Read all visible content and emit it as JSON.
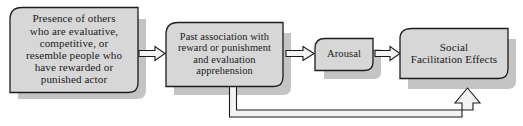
{
  "diagram": {
    "type": "flowchart",
    "orientation": "left-to-right",
    "colors": {
      "box_fill": "#d7d7d7",
      "box_stroke": "#1c1c1c",
      "shadow": "#c4c4c4",
      "arrow_fill": "#f2f2f2",
      "arrow_stroke": "#1c1c1c",
      "text": "#1a1a1a",
      "background": "#ffffff"
    },
    "nodes": [
      {
        "id": "n1",
        "label": "Presence of others\nwho are evaluative,\ncompetitive, or\nresemble people who\nhave rewarded or\npunished actor"
      },
      {
        "id": "n2",
        "label": "Past association with\nreward or punishment\nand evaluation\napprehension"
      },
      {
        "id": "n3",
        "label": "Arousal"
      },
      {
        "id": "n4",
        "label": "Social\nFacilitation Effects"
      }
    ],
    "connectors": [
      {
        "id": "a1",
        "from": "n1",
        "to": "n2",
        "style": "block-arrow",
        "direction": "right"
      },
      {
        "id": "a2",
        "from": "n2",
        "to": "n3",
        "style": "block-arrow",
        "direction": "right"
      },
      {
        "id": "a3",
        "from": "n3",
        "to": "n4",
        "style": "block-arrow",
        "direction": "right"
      },
      {
        "id": "a4",
        "from": "n2",
        "to": "n4",
        "style": "feedback-loop",
        "direction": "up",
        "path": "down-right-up"
      }
    ]
  }
}
